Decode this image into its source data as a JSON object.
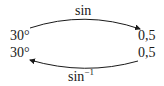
{
  "diagram": {
    "top_arrow_label": "sin",
    "bottom_arrow_label": "sin",
    "bottom_arrow_superscript": "−1",
    "left_top": "30°",
    "left_bottom": "30°",
    "right_top": "0,5",
    "right_bottom": "0,5"
  }
}
